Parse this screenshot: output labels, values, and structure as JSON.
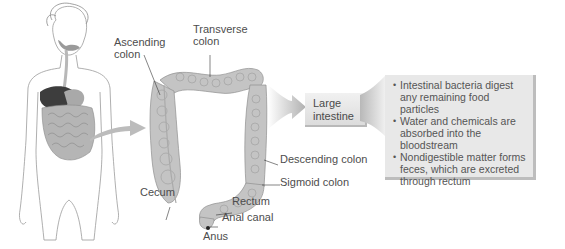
{
  "figure": {
    "labels": {
      "ascending_colon": "Ascending colon",
      "transverse_colon": "Transverse colon",
      "descending_colon": "Descending colon",
      "sigmoid_colon": "Sigmoid colon",
      "cecum": "Cecum",
      "rectum": "Rectum",
      "anal_canal": "Anal canal",
      "anus": "Anus"
    },
    "organ_box": {
      "line1": "Large",
      "line2": "intestine"
    },
    "functions": [
      "Intestinal bacteria digest any remaining food particles",
      "Water and chemicals are absorbed into the bloodstream",
      "Nondigestible matter forms feces, which are excreted through rectum"
    ],
    "colors": {
      "arrow": "#b0b0b0",
      "box_fill": "#e8e8e8",
      "box_shadow": "#bdbdbd",
      "colon_fill": "#bfbfbf",
      "liver": "#3d3d3d"
    }
  }
}
